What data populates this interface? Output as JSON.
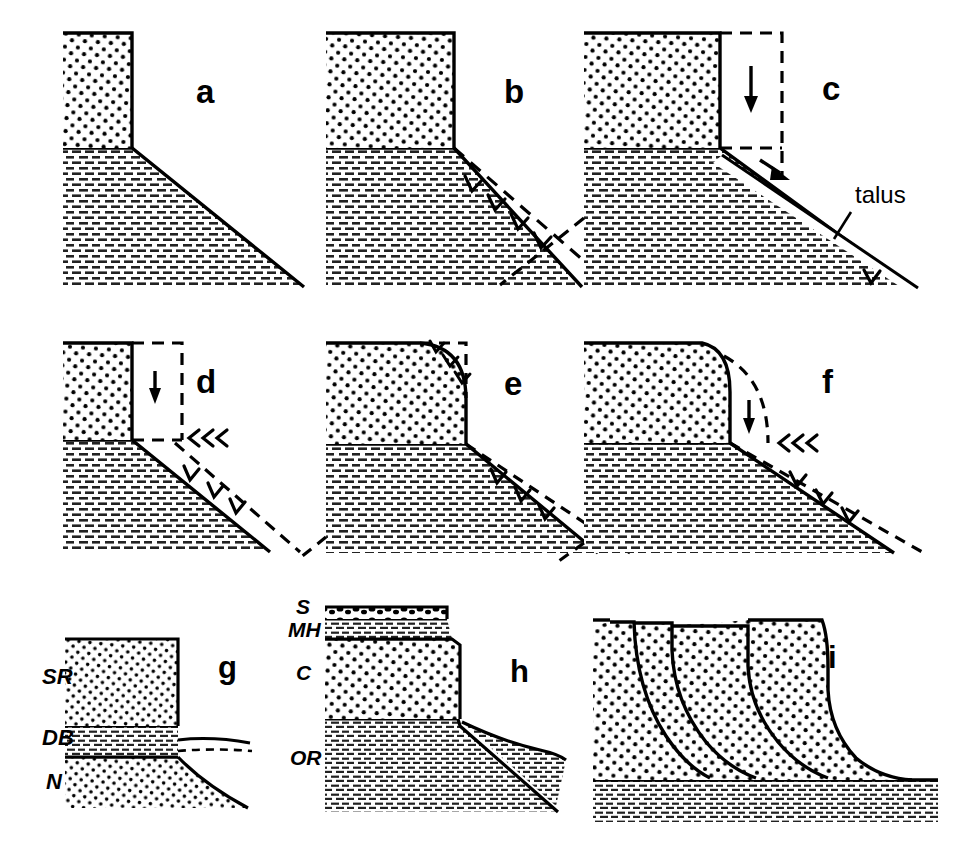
{
  "figure": {
    "background_color": "#ffffff",
    "ink_color": "#000000",
    "width": 968,
    "height": 851
  },
  "panels": [
    {
      "id": "a",
      "letter": "a",
      "letter_x": 196,
      "letter_y": 103,
      "caption_note": "initial vertical scarp with straight debris-free slope"
    },
    {
      "id": "b",
      "letter": "b",
      "letter_x": 504,
      "letter_y": 103,
      "caption_note": "parallel slope retreat, former profile dashed"
    },
    {
      "id": "c",
      "letter": "c",
      "letter_x": 822,
      "letter_y": 100,
      "caption_note": "talus accumulation at scarp foot"
    },
    {
      "id": "d",
      "letter": "d",
      "letter_x": 196,
      "letter_y": 393,
      "caption_note": "scarp lowering plus backwearing"
    },
    {
      "id": "e",
      "letter": "e",
      "letter_x": 504,
      "letter_y": 395,
      "caption_note": "convex rounding of scarp crest"
    },
    {
      "id": "f",
      "letter": "f",
      "letter_x": 822,
      "letter_y": 393,
      "caption_note": "rounded crest with continued backwearing"
    },
    {
      "id": "g",
      "letter": "g",
      "letter_x": 218,
      "letter_y": 678,
      "caption_note": "three-unit stratigraphic example"
    },
    {
      "id": "h",
      "letter": "h",
      "letter_x": 510,
      "letter_y": 682,
      "caption_note": "four-unit stratigraphic example with talus"
    },
    {
      "id": "i",
      "letter": "i",
      "letter_x": 828,
      "letter_y": 668,
      "caption_note": "successive stages of scarp retreat superposed"
    }
  ],
  "annotations": {
    "talus": {
      "text": "talus",
      "x": 855,
      "y": 203
    }
  },
  "stratigraphic_labels": {
    "panel_g": [
      {
        "text": "SR",
        "x": 42,
        "y": 684,
        "lithology": "sandstone-stipple"
      },
      {
        "text": "DB",
        "x": 42,
        "y": 745,
        "lithology": "shale-dash"
      },
      {
        "text": "N",
        "x": 46,
        "y": 789,
        "lithology": "sandstone-stipple"
      }
    ],
    "panel_h": [
      {
        "text": "S",
        "x": 296,
        "y": 614,
        "lithology": "conglomerate-cap"
      },
      {
        "text": "MH",
        "x": 288,
        "y": 637,
        "lithology": "shale-dash"
      },
      {
        "text": "C",
        "x": 296,
        "y": 680,
        "lithology": "sandstone-stipple"
      },
      {
        "text": "OR",
        "x": 290,
        "y": 765,
        "lithology": "shale-dash"
      }
    ]
  },
  "legend_patterns": {
    "sandstone": "stipple-dots",
    "shale": "short-horizontal-dashes",
    "former_position": "dashed-outline",
    "retreat_direction": "chevron-arrows"
  }
}
